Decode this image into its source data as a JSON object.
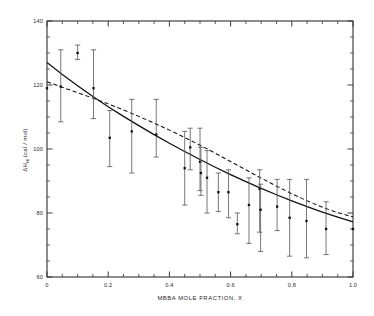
{
  "chart_data": {
    "type": "scatter",
    "title": "",
    "subtitle": "",
    "xlabel": "MBBA MOLE FRACTION, X",
    "ylabel": "ΔH",
    "ylabel_subscript": "NI",
    "ylabel_units": "(cal / mol)",
    "ylabel_full": "ΔH NI (cal / mol)",
    "xlim": [
      0,
      1.0
    ],
    "ylim": [
      60,
      140
    ],
    "xticks": [
      0,
      0.2,
      0.4,
      0.6,
      0.8,
      1.0
    ],
    "xticklabels": [
      "0",
      "0.2",
      "0.4",
      "0.6",
      "0.8",
      "1.0"
    ],
    "yticks": [
      60,
      80,
      100,
      120,
      140
    ],
    "yticklabels": [
      "60",
      "80",
      "100",
      "120",
      "140"
    ],
    "x_minor_interval": 0.05,
    "y_minor_interval": 5,
    "grid": false,
    "legend": "none",
    "marker_style": "filled-square",
    "error_bar_style": "vertical-capped",
    "series": [
      {
        "name": "measured enthalpy of nematic-isotropic transition",
        "style": "points-with-error-bars",
        "points": [
          {
            "x": 0.0,
            "y": 119.0,
            "err_low": 119.0,
            "err_high": 119.0
          },
          {
            "x": 0.045,
            "y": 119.5,
            "err_low": 108.5,
            "err_high": 131.0
          },
          {
            "x": 0.1,
            "y": 130.0,
            "err_low": 128.0,
            "err_high": 132.5
          },
          {
            "x": 0.152,
            "y": 119.0,
            "err_low": 109.5,
            "err_high": 131.0
          },
          {
            "x": 0.205,
            "y": 103.5,
            "err_low": 94.5,
            "err_high": 112.0
          },
          {
            "x": 0.277,
            "y": 105.5,
            "err_low": 92.5,
            "err_high": 115.5
          },
          {
            "x": 0.357,
            "y": 104.5,
            "err_low": 97.5,
            "err_high": 115.5
          },
          {
            "x": 0.45,
            "y": 94.0,
            "err_low": 82.5,
            "err_high": 105.5
          },
          {
            "x": 0.468,
            "y": 100.5,
            "err_low": 93.5,
            "err_high": 106.5
          },
          {
            "x": 0.5,
            "y": 96.0,
            "err_low": 87.0,
            "err_high": 106.5
          },
          {
            "x": 0.503,
            "y": 92.5,
            "err_low": 85.5,
            "err_high": 100.5
          },
          {
            "x": 0.523,
            "y": 91.0,
            "err_low": 80.0,
            "err_high": 99.5
          },
          {
            "x": 0.56,
            "y": 86.5,
            "err_low": 80.5,
            "err_high": 92.5
          },
          {
            "x": 0.593,
            "y": 86.5,
            "err_low": 78.5,
            "err_high": 93.5
          },
          {
            "x": 0.622,
            "y": 76.5,
            "err_low": 73.5,
            "err_high": 80.0
          },
          {
            "x": 0.66,
            "y": 82.5,
            "err_low": 70.5,
            "err_high": 91.0
          },
          {
            "x": 0.695,
            "y": 87.5,
            "err_low": 74.0,
            "err_high": 93.5
          },
          {
            "x": 0.698,
            "y": 81.0,
            "err_low": 68.0,
            "err_high": 89.0
          },
          {
            "x": 0.752,
            "y": 82.0,
            "err_low": 74.5,
            "err_high": 90.5
          },
          {
            "x": 0.793,
            "y": 78.5,
            "err_low": 66.5,
            "err_high": 90.5
          },
          {
            "x": 0.848,
            "y": 77.5,
            "err_low": 66.0,
            "err_high": 90.5
          },
          {
            "x": 0.912,
            "y": 75.0,
            "err_low": 67.0,
            "err_high": 83.5
          },
          {
            "x": 1.0,
            "y": 75.0,
            "err_low": 75.0,
            "err_high": 75.0
          }
        ]
      },
      {
        "name": "solid fitted curve",
        "style": "solid-line",
        "x": [
          0.0,
          0.05,
          0.1,
          0.15,
          0.2,
          0.25,
          0.3,
          0.35,
          0.4,
          0.45,
          0.5,
          0.55,
          0.6,
          0.65,
          0.7,
          0.75,
          0.8,
          0.85,
          0.9,
          0.95,
          1.0
        ],
        "y": [
          127.0,
          123.3,
          119.8,
          116.4,
          113.2,
          110.2,
          107.3,
          104.5,
          101.8,
          99.2,
          96.7,
          94.3,
          92.0,
          89.8,
          87.7,
          85.7,
          83.8,
          82.0,
          80.3,
          78.7,
          77.2
        ]
      },
      {
        "name": "dashed fitted curve",
        "style": "dashed-line",
        "x": [
          0.0,
          0.05,
          0.1,
          0.15,
          0.2,
          0.25,
          0.3,
          0.35,
          0.4,
          0.45,
          0.5,
          0.55,
          0.6,
          0.65,
          0.7,
          0.75,
          0.8,
          0.85,
          0.9,
          0.95,
          1.0
        ],
        "y": [
          121.0,
          119.3,
          117.6,
          115.9,
          114.1,
          112.2,
          110.2,
          108.1,
          105.9,
          103.6,
          101.2,
          98.7,
          96.1,
          93.5,
          90.9,
          88.4,
          86.0,
          83.8,
          81.8,
          80.1,
          78.8
        ]
      }
    ]
  },
  "axes": {
    "x_title": "MBBA MOLE FRACTION, X",
    "y_title_main": "ΔH",
    "y_title_sub": "NI",
    "y_title_units": "(cal / mol)"
  }
}
